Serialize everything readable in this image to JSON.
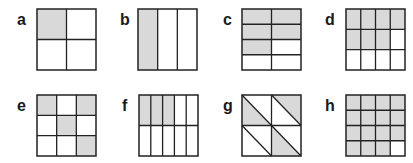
{
  "style": {
    "shade": "#d9d9d9",
    "line": "#222222",
    "background": "#ffffff"
  },
  "figures": [
    {
      "label": "a",
      "x": 37,
      "y": 9,
      "lx": 17,
      "ly": 12,
      "rows": 2,
      "cols": 2,
      "shaded": [
        [
          0,
          0
        ]
      ],
      "fraction": "1/4"
    },
    {
      "label": "b",
      "x": 138,
      "y": 9,
      "lx": 120,
      "ly": 12,
      "rows": 1,
      "cols": 3,
      "shaded": [
        [
          0,
          0
        ]
      ],
      "fraction": "1/3"
    },
    {
      "label": "c",
      "x": 242,
      "y": 9,
      "lx": 223,
      "ly": 12,
      "rows": 4,
      "cols": 2,
      "shaded": [
        [
          0,
          0
        ],
        [
          0,
          1
        ],
        [
          1,
          0
        ],
        [
          1,
          1
        ],
        [
          2,
          0
        ]
      ],
      "fraction": "5/8"
    },
    {
      "label": "d",
      "x": 346,
      "y": 9,
      "lx": 325,
      "ly": 12,
      "rows": 3,
      "cols": 4,
      "shaded": [
        [
          0,
          0
        ],
        [
          0,
          1
        ],
        [
          0,
          2
        ],
        [
          0,
          3
        ],
        [
          1,
          0
        ],
        [
          1,
          1
        ],
        [
          1,
          2
        ]
      ],
      "fraction": "7/12"
    },
    {
      "label": "e",
      "x": 37,
      "y": 95,
      "lx": 17,
      "ly": 98,
      "rows": 3,
      "cols": 3,
      "shaded": [
        [
          0,
          0
        ],
        [
          0,
          2
        ],
        [
          1,
          1
        ],
        [
          2,
          2
        ]
      ],
      "fraction": "4/9"
    },
    {
      "label": "f",
      "x": 139,
      "y": 95,
      "lx": 122,
      "ly": 98,
      "rows": 2,
      "cols": 5,
      "shaded": [
        [
          0,
          0
        ],
        [
          0,
          1
        ],
        [
          0,
          2
        ]
      ],
      "fraction": "3/10"
    },
    {
      "label": "g",
      "x": 242,
      "y": 95,
      "lx": 223,
      "ly": 98,
      "rows": 2,
      "cols": 2,
      "diagonal": true,
      "shaded_triangles": [
        [
          0,
          0,
          "lower"
        ],
        [
          0,
          1,
          "upper"
        ],
        [
          1,
          1,
          "lower"
        ]
      ],
      "fraction": "3/8"
    },
    {
      "label": "h",
      "x": 346,
      "y": 95,
      "lx": 325,
      "ly": 98,
      "rows": 4,
      "cols": 4,
      "shaded": [
        [
          0,
          0
        ],
        [
          0,
          1
        ],
        [
          0,
          2
        ],
        [
          0,
          3
        ],
        [
          1,
          0
        ],
        [
          1,
          1
        ],
        [
          1,
          2
        ],
        [
          1,
          3
        ],
        [
          2,
          0
        ],
        [
          2,
          1
        ],
        [
          2,
          2
        ],
        [
          2,
          3
        ],
        [
          3,
          0
        ],
        [
          3,
          1
        ],
        [
          3,
          2
        ]
      ],
      "fraction": "15/16"
    }
  ]
}
